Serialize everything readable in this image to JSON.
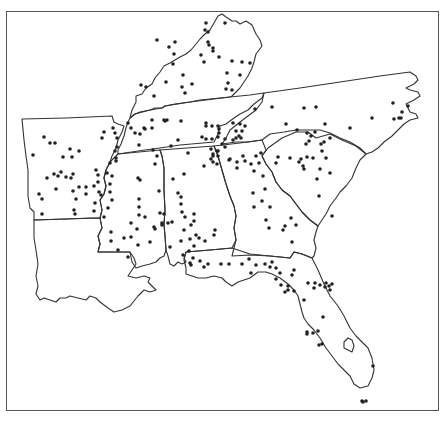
{
  "map": {
    "title": "",
    "region": "Southeastern United States",
    "states": [
      "Kentucky",
      "Tennessee",
      "North Carolina",
      "Arkansas",
      "Louisiana",
      "Mississippi",
      "Alabama",
      "Georgia",
      "South Carolina",
      "Florida"
    ],
    "legend": "",
    "colors": {
      "border": "#333333",
      "dot": "#222222",
      "frame": "#555555",
      "background": "#ffffff"
    },
    "dots": [
      [
        206,
        12
      ],
      [
        225,
        12
      ],
      [
        205,
        19
      ],
      [
        208,
        21
      ],
      [
        157,
        29
      ],
      [
        208,
        31
      ],
      [
        209,
        34
      ],
      [
        175,
        31
      ],
      [
        169,
        36
      ],
      [
        213,
        37
      ],
      [
        213,
        40
      ],
      [
        219,
        46
      ],
      [
        174,
        43
      ],
      [
        173,
        53
      ],
      [
        204,
        51
      ],
      [
        201,
        44
      ],
      [
        232,
        50
      ],
      [
        242,
        51
      ],
      [
        250,
        52
      ],
      [
        227,
        62
      ],
      [
        240,
        64
      ],
      [
        228,
        72
      ],
      [
        226,
        78
      ],
      [
        232,
        79
      ],
      [
        183,
        64
      ],
      [
        166,
        71
      ],
      [
        192,
        73
      ],
      [
        141,
        74
      ],
      [
        146,
        76
      ],
      [
        182,
        76
      ],
      [
        185,
        82
      ],
      [
        154,
        85
      ],
      [
        255,
        98
      ],
      [
        272,
        96
      ],
      [
        128,
        112
      ],
      [
        131,
        117
      ],
      [
        145,
        118
      ],
      [
        152,
        109
      ],
      [
        164,
        109
      ],
      [
        165,
        110
      ],
      [
        167,
        109
      ],
      [
        181,
        110
      ],
      [
        135,
        122
      ],
      [
        140,
        123
      ],
      [
        144,
        117
      ],
      [
        152,
        117
      ],
      [
        206,
        112
      ],
      [
        206,
        115
      ],
      [
        218,
        115
      ],
      [
        212,
        115
      ],
      [
        219,
        118
      ],
      [
        219,
        122
      ],
      [
        233,
        112
      ],
      [
        240,
        113
      ],
      [
        236,
        120
      ],
      [
        236,
        127
      ],
      [
        241,
        127
      ],
      [
        212,
        128
      ],
      [
        206,
        128
      ],
      [
        225,
        128
      ],
      [
        202,
        126
      ],
      [
        139,
        134
      ],
      [
        153,
        139
      ],
      [
        171,
        135
      ],
      [
        157,
        145
      ],
      [
        178,
        129
      ],
      [
        155,
        153
      ],
      [
        188,
        142
      ],
      [
        211,
        138
      ],
      [
        213,
        143
      ],
      [
        217,
        140
      ],
      [
        213,
        145
      ],
      [
        211,
        148
      ],
      [
        213,
        151
      ],
      [
        217,
        153
      ],
      [
        218,
        145
      ],
      [
        222,
        133
      ],
      [
        225,
        136
      ],
      [
        218,
        126
      ],
      [
        218,
        140
      ],
      [
        204,
        155
      ],
      [
        229,
        149
      ],
      [
        245,
        115
      ],
      [
        242,
        120
      ],
      [
        239,
        125
      ],
      [
        233,
        129
      ],
      [
        304,
        97
      ],
      [
        316,
        96
      ],
      [
        286,
        113
      ],
      [
        297,
        119
      ],
      [
        325,
        113
      ],
      [
        350,
        117
      ],
      [
        330,
        127
      ],
      [
        324,
        131
      ],
      [
        372,
        107
      ],
      [
        393,
        92
      ],
      [
        402,
        101
      ],
      [
        401,
        107
      ],
      [
        399,
        107
      ],
      [
        394,
        108
      ],
      [
        408,
        95
      ],
      [
        33,
        144
      ],
      [
        44,
        126
      ],
      [
        50,
        132
      ],
      [
        55,
        132
      ],
      [
        70,
        138
      ],
      [
        63,
        146
      ],
      [
        72,
        146
      ],
      [
        79,
        140
      ],
      [
        104,
        121
      ],
      [
        102,
        127
      ],
      [
        113,
        117
      ],
      [
        115,
        122
      ],
      [
        117,
        127
      ],
      [
        117,
        136
      ],
      [
        115,
        140
      ],
      [
        96,
        159
      ],
      [
        54,
        163
      ],
      [
        61,
        161
      ],
      [
        58,
        165
      ],
      [
        66,
        166
      ],
      [
        73,
        163
      ],
      [
        71,
        167
      ],
      [
        47,
        167
      ],
      [
        56,
        178
      ],
      [
        39,
        183
      ],
      [
        42,
        188
      ],
      [
        73,
        180
      ],
      [
        79,
        176
      ],
      [
        86,
        176
      ],
      [
        86,
        183
      ],
      [
        94,
        175
      ],
      [
        98,
        164
      ],
      [
        98,
        171
      ],
      [
        99,
        181
      ],
      [
        74,
        199
      ],
      [
        75,
        203
      ],
      [
        42,
        203
      ],
      [
        76,
        188
      ],
      [
        116,
        147
      ],
      [
        116,
        150
      ],
      [
        110,
        152
      ],
      [
        107,
        162
      ],
      [
        112,
        165
      ],
      [
        110,
        173
      ],
      [
        110,
        181
      ],
      [
        112,
        189
      ],
      [
        108,
        197
      ],
      [
        101,
        184
      ],
      [
        95,
        192
      ],
      [
        94,
        200
      ],
      [
        104,
        206
      ],
      [
        138,
        167
      ],
      [
        140,
        169
      ],
      [
        159,
        180
      ],
      [
        139,
        188
      ],
      [
        139,
        196
      ],
      [
        139,
        204
      ],
      [
        145,
        206
      ],
      [
        160,
        202
      ],
      [
        162,
        212
      ],
      [
        155,
        218
      ],
      [
        137,
        218
      ],
      [
        131,
        226
      ],
      [
        138,
        234
      ],
      [
        150,
        231
      ],
      [
        170,
        236
      ],
      [
        168,
        212
      ],
      [
        162,
        214
      ],
      [
        164,
        203
      ],
      [
        154,
        216
      ],
      [
        131,
        212
      ],
      [
        124,
        227
      ],
      [
        118,
        239
      ],
      [
        128,
        246
      ],
      [
        111,
        221
      ],
      [
        111,
        230
      ],
      [
        173,
        168
      ],
      [
        184,
        163
      ],
      [
        178,
        182
      ],
      [
        181,
        186
      ],
      [
        181,
        193
      ],
      [
        182,
        201
      ],
      [
        172,
        211
      ],
      [
        191,
        214
      ],
      [
        184,
        219
      ],
      [
        185,
        206
      ],
      [
        194,
        203
      ],
      [
        194,
        210
      ],
      [
        190,
        228
      ],
      [
        196,
        224
      ],
      [
        181,
        230
      ],
      [
        183,
        244
      ],
      [
        189,
        240
      ],
      [
        194,
        235
      ],
      [
        193,
        247
      ],
      [
        199,
        227
      ],
      [
        205,
        230
      ],
      [
        215,
        219
      ],
      [
        214,
        224
      ],
      [
        190,
        252
      ],
      [
        200,
        250
      ],
      [
        191,
        254
      ],
      [
        204,
        256
      ],
      [
        208,
        253
      ],
      [
        230,
        148
      ],
      [
        245,
        150
      ],
      [
        237,
        151
      ],
      [
        243,
        145
      ],
      [
        251,
        153
      ],
      [
        254,
        160
      ],
      [
        259,
        152
      ],
      [
        263,
        165
      ],
      [
        265,
        178
      ],
      [
        253,
        182
      ],
      [
        262,
        190
      ],
      [
        254,
        196
      ],
      [
        270,
        196
      ],
      [
        266,
        209
      ],
      [
        269,
        217
      ],
      [
        283,
        219
      ],
      [
        285,
        215
      ],
      [
        291,
        207
      ],
      [
        296,
        214
      ],
      [
        292,
        231
      ],
      [
        251,
        262
      ],
      [
        256,
        254
      ],
      [
        265,
        253
      ],
      [
        270,
        256
      ],
      [
        280,
        262
      ],
      [
        301,
        148
      ],
      [
        303,
        155
      ],
      [
        290,
        147
      ],
      [
        278,
        146
      ],
      [
        276,
        152
      ],
      [
        261,
        142
      ],
      [
        256,
        145
      ],
      [
        237,
        157
      ],
      [
        315,
        121
      ],
      [
        321,
        133
      ],
      [
        320,
        158
      ],
      [
        317,
        168
      ],
      [
        319,
        185
      ],
      [
        313,
        147
      ],
      [
        322,
        140
      ],
      [
        307,
        146
      ],
      [
        299,
        151
      ],
      [
        306,
        133
      ],
      [
        309,
        130
      ],
      [
        311,
        125
      ],
      [
        307,
        122
      ],
      [
        326,
        147
      ],
      [
        330,
        162
      ],
      [
        304,
        158
      ],
      [
        272,
        251
      ],
      [
        276,
        257
      ],
      [
        276,
        268
      ],
      [
        281,
        274
      ],
      [
        292,
        264
      ],
      [
        294,
        259
      ],
      [
        288,
        275
      ],
      [
        288,
        279
      ],
      [
        294,
        280
      ],
      [
        285,
        281
      ],
      [
        314,
        277
      ],
      [
        315,
        272
      ],
      [
        308,
        272
      ],
      [
        320,
        274
      ],
      [
        326,
        272
      ],
      [
        332,
        273
      ],
      [
        325,
        276
      ],
      [
        329,
        275
      ],
      [
        330,
        279
      ],
      [
        304,
        289
      ],
      [
        323,
        306
      ],
      [
        307,
        321
      ],
      [
        313,
        322
      ],
      [
        307,
        323
      ],
      [
        318,
        320
      ],
      [
        322,
        333
      ],
      [
        319,
        334
      ],
      [
        373,
        355
      ],
      [
        362,
        390
      ],
      [
        363,
        391
      ],
      [
        366,
        390
      ],
      [
        332,
        205
      ],
      [
        221,
        253
      ],
      [
        229,
        253
      ],
      [
        242,
        253
      ],
      [
        249,
        248
      ]
    ]
  },
  "caption": {
    "text": ""
  }
}
